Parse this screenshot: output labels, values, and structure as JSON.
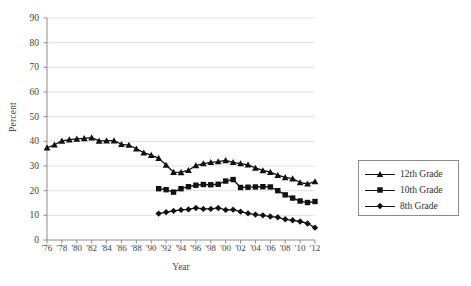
{
  "chart_data": {
    "type": "line",
    "title": "",
    "xlabel": "Year",
    "ylabel": "Percent",
    "xlim": [
      1976,
      2012
    ],
    "ylim": [
      0,
      90
    ],
    "ytick_step": 10,
    "xtick_step": 2,
    "grid": "horizontal",
    "legend_position": "right",
    "x": [
      1976,
      1977,
      1978,
      1979,
      1980,
      1981,
      1982,
      1983,
      1984,
      1985,
      1986,
      1987,
      1988,
      1989,
      1990,
      1991,
      1992,
      1993,
      1994,
      1995,
      1996,
      1997,
      1998,
      1999,
      2000,
      2001,
      2002,
      2003,
      2004,
      2005,
      2006,
      2007,
      2008,
      2009,
      2010,
      2011,
      2012
    ],
    "yticks": [
      "0",
      "10",
      "20",
      "30",
      "40",
      "50",
      "60",
      "70",
      "80",
      "90"
    ],
    "xticks": [
      "'76",
      "'78",
      "'80",
      "'82",
      "'84",
      "'86",
      "'88",
      "'90",
      "'92",
      "'94",
      "'96",
      "'98",
      "'00",
      "'02",
      "'04",
      "'06",
      "'08",
      "'10",
      "'12"
    ],
    "series": [
      {
        "name": "12th Grade",
        "marker": "triangle",
        "color": "#111111",
        "x": [
          1976,
          1977,
          1978,
          1979,
          1980,
          1981,
          1982,
          1983,
          1984,
          1985,
          1986,
          1987,
          1988,
          1989,
          1990,
          1991,
          1992,
          1993,
          1994,
          1995,
          1996,
          1997,
          1998,
          1999,
          2000,
          2001,
          2002,
          2003,
          2004,
          2005,
          2006,
          2007,
          2008,
          2009,
          2010,
          2011,
          2012
        ],
        "values": [
          37.4,
          38.6,
          40.2,
          40.7,
          41.0,
          41.2,
          41.5,
          40.2,
          40.3,
          40.3,
          38.8,
          38.5,
          37.0,
          35.4,
          34.4,
          33.2,
          30.4,
          27.5,
          27.4,
          28.3,
          30.2,
          31.0,
          31.5,
          31.8,
          32.3,
          31.5,
          31.0,
          30.5,
          29.2,
          28.2,
          27.5,
          26.3,
          25.4,
          24.9,
          23.3,
          22.8,
          23.7
        ]
      },
      {
        "name": "10th Grade",
        "marker": "square",
        "color": "#111111",
        "x": [
          1991,
          1992,
          1993,
          1994,
          1995,
          1996,
          1997,
          1998,
          1999,
          2000,
          2001,
          2002,
          2003,
          2004,
          2005,
          2006,
          2007,
          2008,
          2009,
          2010,
          2011,
          2012
        ],
        "values": [
          20.8,
          20.4,
          19.4,
          20.8,
          21.6,
          22.2,
          22.5,
          22.4,
          22.6,
          23.9,
          24.5,
          21.3,
          21.4,
          21.5,
          21.6,
          21.5,
          20.0,
          18.3,
          17.0,
          15.8,
          15.2,
          15.6
        ]
      },
      {
        "name": "8th Grade",
        "marker": "diamond",
        "color": "#111111",
        "x": [
          1991,
          1992,
          1993,
          1994,
          1995,
          1996,
          1997,
          1998,
          1999,
          2000,
          2001,
          2002,
          2003,
          2004,
          2005,
          2006,
          2007,
          2008,
          2009,
          2010,
          2011,
          2012
        ],
        "values": [
          10.7,
          11.3,
          11.8,
          12.2,
          12.4,
          13.0,
          12.6,
          12.6,
          13.0,
          12.2,
          12.3,
          11.5,
          10.8,
          10.3,
          10.0,
          9.5,
          9.2,
          8.4,
          8.0,
          7.5,
          6.7,
          5.0
        ]
      }
    ]
  },
  "legend": {
    "items": [
      {
        "label": "12th Grade",
        "marker": "triangle"
      },
      {
        "label": "10th Grade",
        "marker": "square"
      },
      {
        "label": "8th Grade",
        "marker": "diamond"
      }
    ]
  },
  "colors": {
    "line": "#111111",
    "grid": "#d9d9d9",
    "axis": "#8c8c8c",
    "text": "#3a3a3a"
  }
}
